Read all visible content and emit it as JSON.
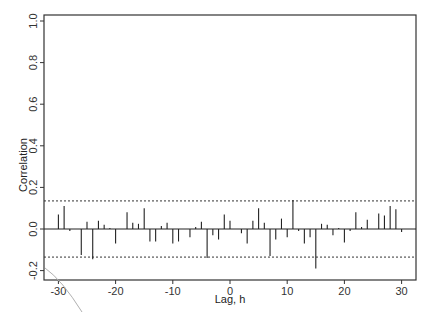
{
  "chart_data": {
    "type": "bar",
    "subtype": "stem-correlogram",
    "title": "",
    "xlabel": "Lag, h",
    "ylabel": "Correlation",
    "xlim": [
      -32,
      32
    ],
    "ylim": [
      -0.25,
      1.05
    ],
    "xticks": [
      -30,
      -20,
      -10,
      0,
      10,
      20,
      30
    ],
    "xtick_labels": [
      "-30",
      "-20",
      "-10",
      "0",
      "10",
      "20",
      "30"
    ],
    "yticks": [
      -0.2,
      0.0,
      0.2,
      0.4,
      0.6,
      0.8,
      1.0
    ],
    "ytick_labels": [
      "-0.2",
      "0.0",
      "0.2",
      "0.4",
      "0.6",
      "0.8",
      "1.0"
    ],
    "grid": false,
    "legend": null,
    "confidence_band": {
      "upper": 0.135,
      "lower": -0.135,
      "style": "dotted"
    },
    "x": [
      -30,
      -29,
      -28,
      -27,
      -26,
      -25,
      -24,
      -23,
      -22,
      -21,
      -20,
      -19,
      -18,
      -17,
      -16,
      -15,
      -14,
      -13,
      -12,
      -11,
      -10,
      -9,
      -8,
      -7,
      -6,
      -5,
      -4,
      -3,
      -2,
      -1,
      0,
      1,
      2,
      3,
      4,
      5,
      6,
      7,
      8,
      9,
      10,
      11,
      12,
      13,
      14,
      15,
      16,
      17,
      18,
      19,
      20,
      21,
      22,
      23,
      24,
      25,
      26,
      27,
      28,
      29,
      30
    ],
    "values": [
      0.07,
      0.11,
      -0.01,
      0.0,
      -0.125,
      0.035,
      -0.145,
      0.04,
      0.02,
      0.005,
      -0.07,
      0.0,
      0.08,
      0.03,
      0.025,
      0.1,
      -0.06,
      -0.06,
      0.015,
      0.03,
      -0.07,
      -0.06,
      0.0,
      -0.04,
      0.01,
      0.035,
      -0.14,
      -0.03,
      -0.05,
      0.07,
      0.04,
      0.0,
      -0.02,
      -0.07,
      0.04,
      0.1,
      0.03,
      -0.13,
      -0.05,
      0.05,
      -0.04,
      0.14,
      -0.01,
      -0.07,
      -0.04,
      -0.19,
      0.025,
      0.02,
      -0.03,
      0.005,
      -0.065,
      -0.01,
      0.08,
      0.01,
      0.045,
      0.0,
      0.075,
      0.065,
      0.11,
      0.095,
      -0.015
    ]
  }
}
